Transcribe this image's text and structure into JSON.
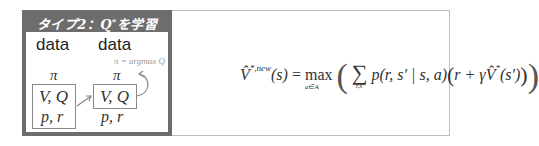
{
  "left_panel": {
    "title_prefix": "タイプ2：",
    "title_symbol": "Q",
    "title_sup": "*",
    "title_suffix": "を学習",
    "columns": [
      {
        "data_label": "data",
        "policy": "π",
        "values": "V, Q",
        "model": "p, r",
        "boxed": true
      },
      {
        "data_label": "data",
        "policy": "π",
        "values": "V, Q",
        "model": "p, r",
        "boxed": false
      }
    ],
    "annotation": "π = argmax Q",
    "colors": {
      "title_bg": "#6d6d6d",
      "title_text": "#ffffff",
      "box_border": "#888888",
      "annotation": "#9a9a9a"
    }
  },
  "right_panel": {
    "formula": {
      "lhs_symbol": "V̂",
      "lhs_sup": "*,new",
      "lhs_arg": "(s)",
      "equals": "=",
      "max_op": "max",
      "max_sub": "a∈A",
      "max_sub_s": "s",
      "sum_op": "∑",
      "sum_sub": "r,s′",
      "term_p": "p(r, s′ | s, a)",
      "term_r": "r + γ",
      "term_v": "V̂",
      "term_v_sup": "*",
      "term_v_arg": "(s′)"
    },
    "colors": {
      "border": "#bdbdbd"
    }
  }
}
